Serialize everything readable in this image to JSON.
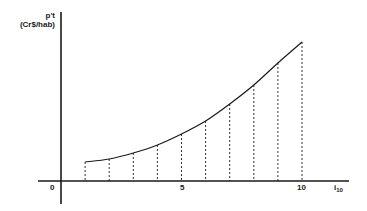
{
  "chart_data": {
    "type": "line",
    "title": "",
    "ylabel": "p't",
    "ylabel_unit": "(Cr$/hab)",
    "xlabel": "i",
    "xlabel_subscript": "10",
    "x_ticks": [
      "0",
      "5",
      "10"
    ],
    "x": [
      1,
      2,
      3,
      4,
      5,
      6,
      7,
      8,
      9,
      10
    ],
    "series": [
      {
        "name": "p't",
        "values_relative": [
          19,
          22,
          28,
          36,
          47,
          60,
          77,
          96,
          118,
          139
        ],
        "note": "no y-axis scale shown; values are relative heights above x-axis"
      }
    ],
    "xlim": [
      0,
      10
    ],
    "grid": false,
    "dashed_drop_lines": true,
    "legend": null
  },
  "labels": {
    "y_name": "p't",
    "y_unit": "(Cr$/hab)",
    "origin": "0",
    "tick_5": "5",
    "tick_10": "10",
    "x_name": "i",
    "x_sub": "10"
  },
  "colors": {
    "ink": "#1a1a1a",
    "background": "#ffffff"
  }
}
